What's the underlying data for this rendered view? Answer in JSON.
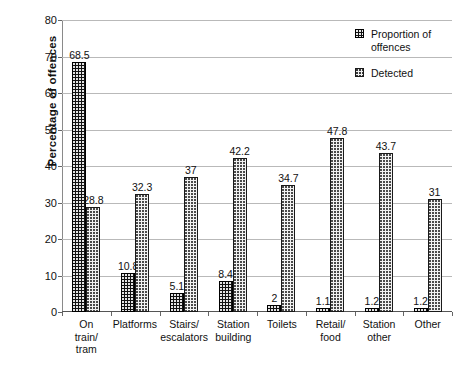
{
  "chart_data": {
    "type": "bar",
    "title": "",
    "xlabel": "",
    "ylabel": "Percentage of offences",
    "ylim": [
      0,
      80
    ],
    "ytick_step": 10,
    "yticks": [
      "0",
      "10",
      "20",
      "30",
      "40",
      "50",
      "60",
      "70",
      "80"
    ],
    "grid": true,
    "legend_position": "top-right",
    "categories": [
      "On train/ tram",
      "Platforms",
      "Stairs/ escalators",
      "Station building",
      "Toilets",
      "Retail/ food",
      "Station other",
      "Other"
    ],
    "category_lines": [
      [
        "On",
        "train/",
        "tram"
      ],
      [
        "Platforms"
      ],
      [
        "Stairs/",
        "escalators"
      ],
      [
        "Station",
        "building"
      ],
      [
        "Toilets"
      ],
      [
        "Retail/",
        "food"
      ],
      [
        "Station",
        "other"
      ],
      [
        "Other"
      ]
    ],
    "series": [
      {
        "name": "Proportion of offences",
        "values": [
          68.5,
          10.8,
          5.1,
          8.4,
          2,
          1.1,
          1.2,
          1.2
        ],
        "labels": [
          "68.5",
          "10.8",
          "5.1",
          "8.4",
          "2",
          "1.1",
          "1.2",
          "1.2"
        ],
        "pattern": "black-with-white-dots",
        "color": "#111111"
      },
      {
        "name": "Detected",
        "values": [
          28.8,
          32.3,
          37,
          42.2,
          34.7,
          47.8,
          43.7,
          31
        ],
        "labels": [
          "28.8",
          "32.3",
          "37",
          "42.2",
          "34.7",
          "47.8",
          "43.7",
          "31"
        ],
        "pattern": "light-grey-dot-grid",
        "color": "#f0f0f0"
      }
    ]
  },
  "legend": {
    "items": [
      {
        "label": "Proportion of offences",
        "swatch": "prop"
      },
      {
        "label": "Detected",
        "swatch": "det"
      }
    ]
  }
}
